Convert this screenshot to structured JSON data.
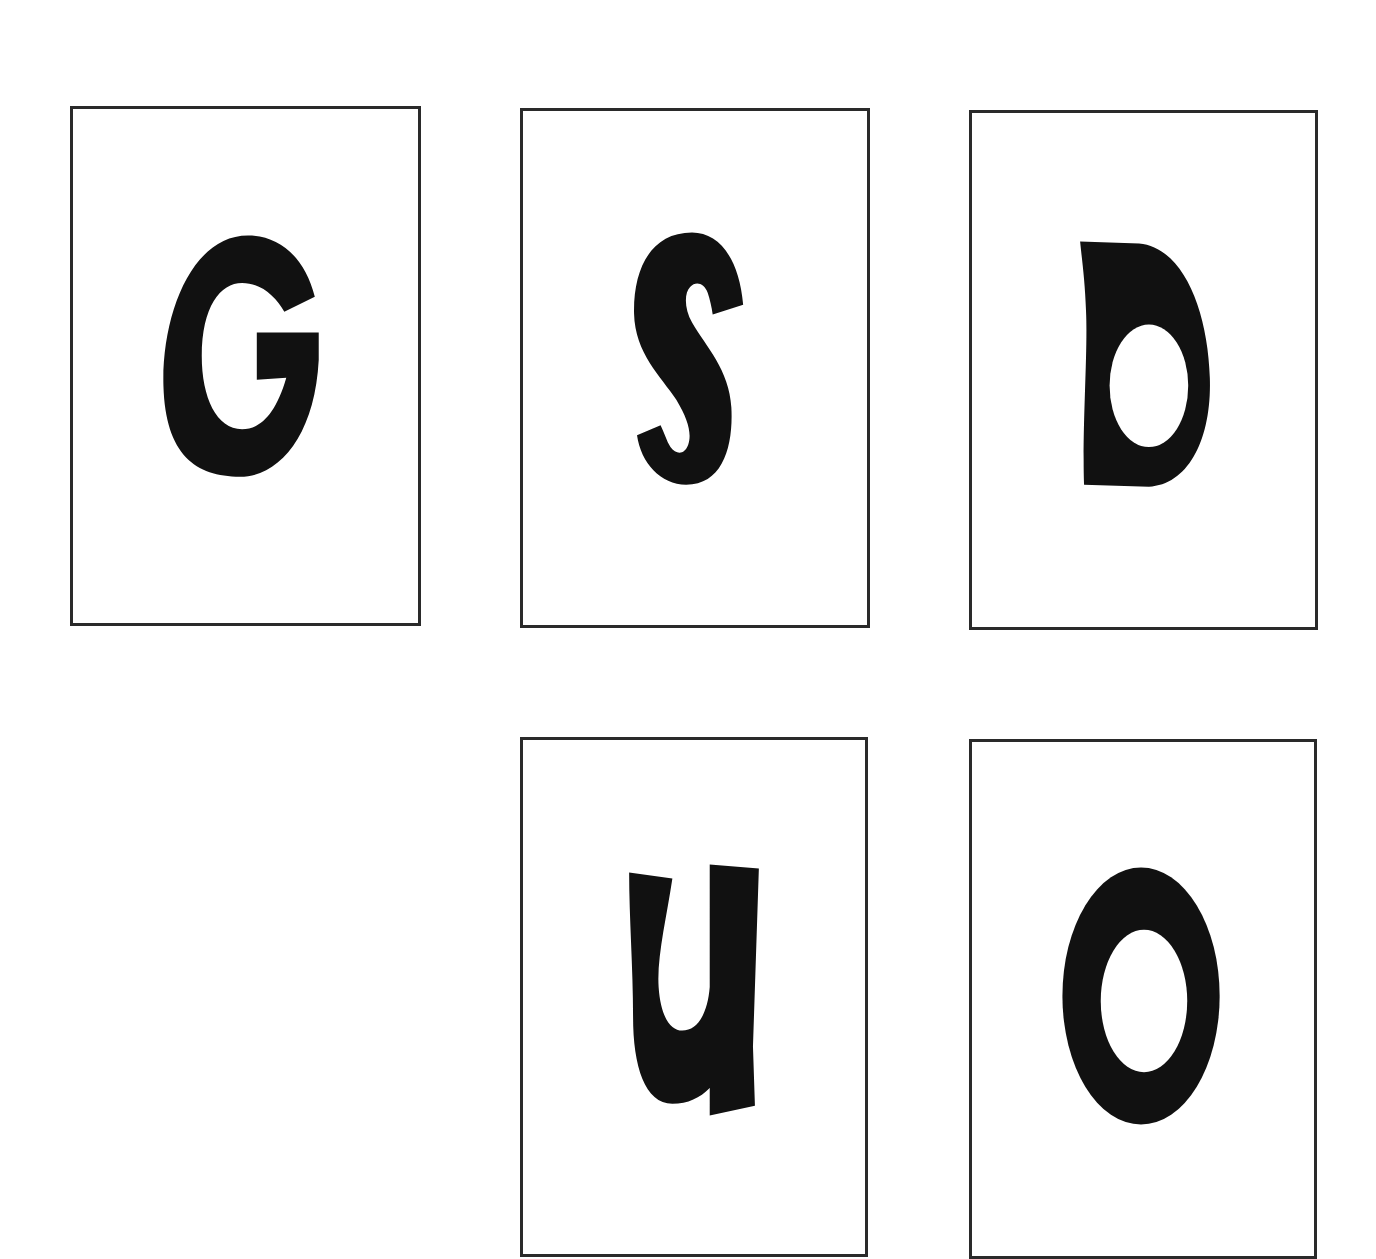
{
  "sheet": {
    "background_color": "#ffffff",
    "border_color": "#2a2a2a",
    "glyph_color": "#111111"
  },
  "cards": [
    {
      "letter": "G",
      "row": 1,
      "column": 1
    },
    {
      "letter": "S",
      "row": 1,
      "column": 2
    },
    {
      "letter": "D",
      "row": 1,
      "column": 3
    },
    {
      "letter": "U",
      "row": 2,
      "column": 2
    },
    {
      "letter": "O",
      "row": 2,
      "column": 3
    }
  ]
}
